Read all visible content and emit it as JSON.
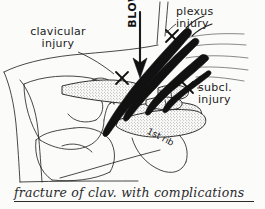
{
  "figure": {
    "caption": "fracture of clav. with complications",
    "background_color": "#fbfbfa",
    "ink_color": "#1b1b1b",
    "bone_fill": "stipple"
  },
  "labels": {
    "clavicular_injury": "clavicular\ninjury",
    "plexus_injury": "plexus\ninjury",
    "subclavian_injury": "subcl.\ninjury",
    "blow": "BLOW",
    "first_rib": "1st rib"
  },
  "markers": [
    {
      "name": "clavicular-injury-marker",
      "glyph": "x"
    },
    {
      "name": "plexus-injury-marker",
      "glyph": "x"
    },
    {
      "name": "subclavian-injury-marker",
      "glyph": "x"
    }
  ],
  "anatomy": [
    {
      "name": "clavicle",
      "style": "stippled-bone"
    },
    {
      "name": "first-rib",
      "style": "stippled-bone"
    },
    {
      "name": "scapula",
      "style": "outline"
    },
    {
      "name": "humeral-head",
      "style": "outline"
    },
    {
      "name": "brachial-plexus",
      "style": "solid-black"
    },
    {
      "name": "subclavian-vessels",
      "style": "solid-black"
    },
    {
      "name": "chest-wall-outline",
      "style": "outline"
    },
    {
      "name": "cervical-nerve-roots",
      "style": "outline"
    }
  ],
  "arrow": {
    "name": "blow-arrow",
    "direction": "down"
  }
}
